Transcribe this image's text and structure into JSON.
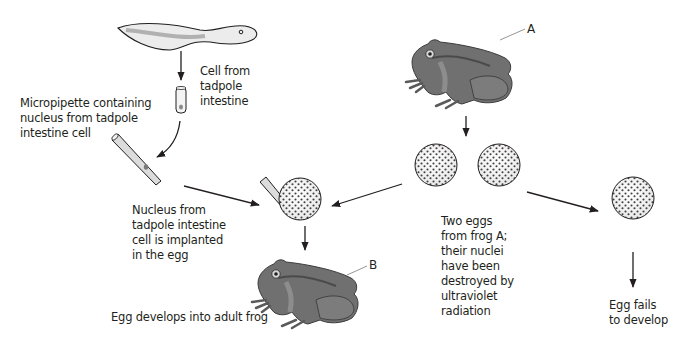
{
  "diagram": {
    "colors": {
      "frog_body": "#6f6f6f",
      "frog_dark": "#4a4a4a",
      "frog_light": "#9a9a9a",
      "tadpole_fill": "#e6e6e6",
      "arrow": "#231f20",
      "pipette": "#d9d9d9"
    },
    "labels": {
      "cell_from_tadpole": "Cell from\ntadpole\nintestine",
      "micropipette": "Micropipette containing\nnucleus from tadpole\nintestine cell",
      "nucleus_implanted": "Nucleus from\ntadpole intestine\ncell is implanted\nin the egg",
      "egg_develops": "Egg develops into adult frog",
      "two_eggs": "Two eggs\nfrom frog A;\ntheir nuclei\nhave been\ndestroyed by\nultraviolet\nradiation",
      "egg_fails": "Egg fails\nto develop",
      "frog_a": "A",
      "frog_b": "B"
    },
    "nodes": [
      {
        "id": "tadpole",
        "name": "Tadpole"
      },
      {
        "id": "intestine-cell",
        "name": "Cell from tadpole intestine"
      },
      {
        "id": "micropipette",
        "name": "Micropipette with nucleus"
      },
      {
        "id": "frog-a",
        "name": "Frog A"
      },
      {
        "id": "egg-1",
        "name": "Enucleated egg 1"
      },
      {
        "id": "egg-2",
        "name": "Enucleated egg 2"
      },
      {
        "id": "implanted-egg",
        "name": "Egg with implanted nucleus"
      },
      {
        "id": "frog-b",
        "name": "Frog B (adult)"
      },
      {
        "id": "failed-egg",
        "name": "Egg that fails to develop"
      }
    ],
    "edges": [
      {
        "from": "tadpole",
        "to": "intestine-cell"
      },
      {
        "from": "intestine-cell",
        "to": "micropipette"
      },
      {
        "from": "micropipette",
        "to": "implanted-egg"
      },
      {
        "from": "frog-a",
        "to": "egg-1"
      },
      {
        "from": "egg-1",
        "to": "implanted-egg"
      },
      {
        "from": "egg-2",
        "to": "failed-egg"
      },
      {
        "from": "implanted-egg",
        "to": "frog-b"
      },
      {
        "from": "failed-egg",
        "to": "fails-label"
      }
    ]
  }
}
